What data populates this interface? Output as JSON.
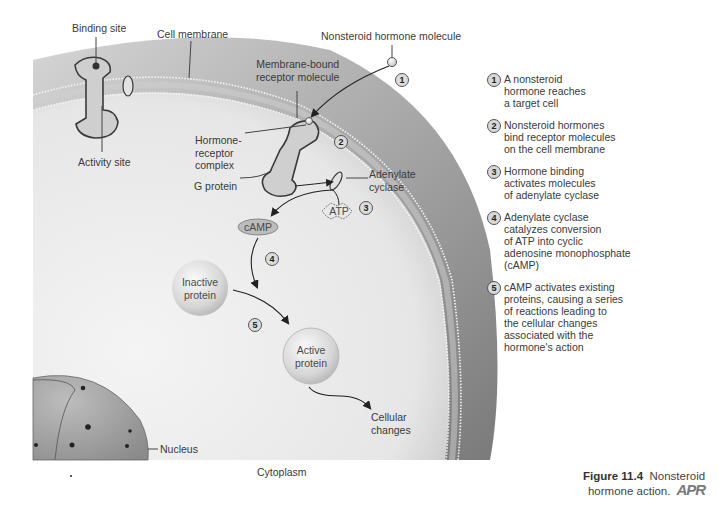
{
  "figure": {
    "number": "Figure 11.4",
    "title": "Nonsteroid hormone action.",
    "badge": "APR"
  },
  "labels": {
    "binding_site": "Binding site",
    "activity_site": "Activity site",
    "cell_membrane": "Cell membrane",
    "hormone_molecule": "Nonsteroid hormone molecule",
    "receptor_molecule_line1": "Membrane-bound",
    "receptor_molecule_line2": "receptor molecule",
    "hormone_receptor_line1": "Hormone-",
    "hormone_receptor_line2": "receptor",
    "hormone_receptor_line3": "complex",
    "g_protein": "G protein",
    "adenylate_line1": "Adenylate",
    "adenylate_line2": "cyclase",
    "atp": "ATP",
    "camp": "cAMP",
    "inactive_line1": "Inactive",
    "inactive_line2": "protein",
    "active_line1": "Active",
    "active_line2": "protein",
    "cellular_line1": "Cellular",
    "cellular_line2": "changes",
    "nucleus": "Nucleus",
    "cytoplasm": "Cytoplasm"
  },
  "diagram_markers": [
    "1",
    "2",
    "3",
    "4",
    "5"
  ],
  "steps": [
    {
      "num": "1",
      "text": "A nonsteroid\nhormone reaches\na target cell"
    },
    {
      "num": "2",
      "text": "Nonsteroid hormones\nbind receptor molecules\non the cell membrane"
    },
    {
      "num": "3",
      "text": "Hormone binding\nactivates molecules\nof adenylate cyclase"
    },
    {
      "num": "4",
      "text": "Adenylate cyclase\ncatalyzes conversion\nof ATP into cyclic\nadenosine monophosphate\n(cAMP)"
    },
    {
      "num": "5",
      "text": "cAMP activates existing\nproteins, causing a series\nof reactions leading to\nthe cellular changes\nassociated with the\nhormone's action"
    }
  ],
  "colors": {
    "membrane_outer": "#8a8a8a",
    "cytoplasm": "#ececec",
    "protein": "#cfcfcf",
    "outline": "#3a3a3a"
  }
}
